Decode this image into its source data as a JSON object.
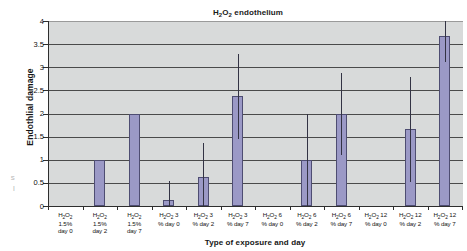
{
  "stray_margin_text": "s\nl",
  "chart_data": {
    "type": "bar",
    "title": "H2O2 endothelium",
    "title_parts": {
      "pre": "H",
      "sub1": "2",
      "mid": "O",
      "sub2": "2",
      "post": " endothelium"
    },
    "xlabel": "Type of exposure and day",
    "ylabel": "Endothlial damage",
    "ylim": [
      0,
      4
    ],
    "ytick_values": [
      0,
      0.5,
      1,
      1.5,
      2,
      2.5,
      3,
      3.5,
      4
    ],
    "ytick_labels": [
      "0",
      "0.5",
      "1",
      "1.5",
      "2",
      "2.5",
      "3",
      "3.5",
      "4"
    ],
    "grid": true,
    "legend": "none",
    "bar_color": "#9b99c6",
    "bar_edge_color": "#4e4d72",
    "plot_bg_color": "#d8dada",
    "axis_color": "#2e2e2e",
    "categories": [
      "H2O2 1.5% day 0",
      "H2O2 1.5% day 2",
      "H2O2 1.5% day 7",
      "H2O2 3 % day 0",
      "H2O2 3 % day 2",
      "H2O2 3 % day 7",
      "H2O2 6 % day 0",
      "H2O2 6 % day 2",
      "H2O2 6 % day 7",
      "H2O2 12 % day 0",
      "H2O2 12 % day 2",
      "H2O2 12 % day 7"
    ],
    "category_label_lines": [
      [
        "H2O2",
        "1.5%",
        "day 0"
      ],
      [
        "H2O2",
        "1.5%",
        "day 2"
      ],
      [
        "H2O2",
        "1.5%",
        "day 7"
      ],
      [
        "H2O2 3",
        "% day 0"
      ],
      [
        "H2O2 3",
        "% day 2"
      ],
      [
        "H2O2 3",
        "% day 7"
      ],
      [
        "H2O2 6",
        "% day 0"
      ],
      [
        "H2O2 6",
        "% day 2"
      ],
      [
        "H2O2 6",
        "% day 7"
      ],
      [
        "H2O2 12",
        "% day 0"
      ],
      [
        "H2O2 12",
        "% day 2"
      ],
      [
        "H2O2 12",
        "% day 7"
      ]
    ],
    "values": [
      0,
      1.0,
      2.0,
      0.13,
      0.63,
      2.38,
      0,
      1.0,
      2.0,
      0,
      1.67,
      3.67
    ],
    "error_bars": [
      null,
      null,
      null,
      {
        "low": 0.0,
        "high": 0.55
      },
      {
        "low": 0.0,
        "high": 1.36
      },
      {
        "low": 1.44,
        "high": 3.28
      },
      null,
      {
        "low": 0.0,
        "high": 2.0
      },
      {
        "low": 1.11,
        "high": 2.87
      },
      null,
      {
        "low": 0.52,
        "high": 2.8
      },
      {
        "low": 3.12,
        "high": 4.0
      }
    ]
  }
}
